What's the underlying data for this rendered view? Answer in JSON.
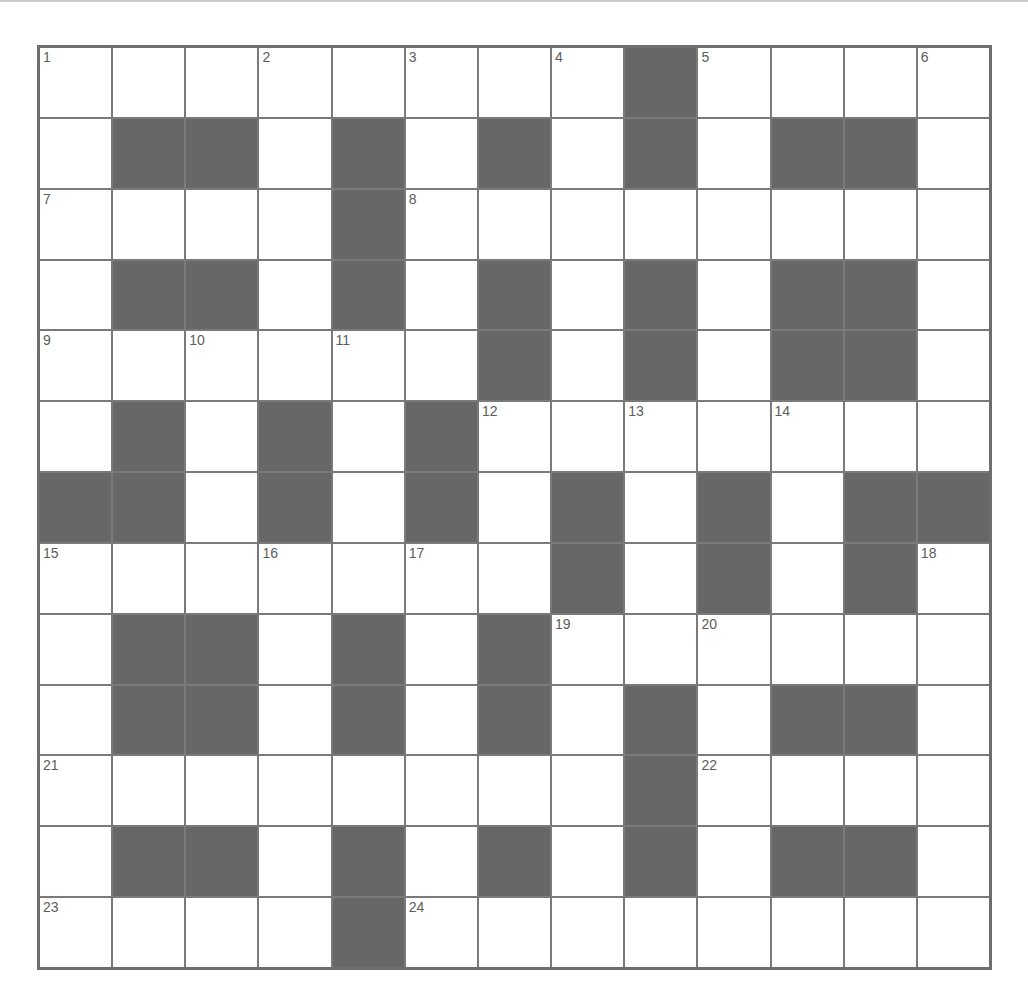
{
  "puzzle": {
    "rows": 13,
    "cols": 13,
    "colors": {
      "block": "#676767",
      "open": "#ffffff",
      "grid_line": "#7a7a7a",
      "number": "#5c5c5c"
    },
    "layout": [
      "........#....",
      ".##.#.#.#.##.",
      "....#........",
      ".##.#.#.#.##.",
      "......#.#.##.",
      ".#.#.#.......",
      "##.#.#.#.#.##",
      ".......#.#.#.",
      ".##.#.#......",
      ".##.#.#.#.##.",
      "........#....",
      ".##.#.#.#.##.",
      "....#........"
    ],
    "numbers": [
      {
        "r": 0,
        "c": 0,
        "n": "1"
      },
      {
        "r": 0,
        "c": 3,
        "n": "2"
      },
      {
        "r": 0,
        "c": 5,
        "n": "3"
      },
      {
        "r": 0,
        "c": 7,
        "n": "4"
      },
      {
        "r": 0,
        "c": 9,
        "n": "5"
      },
      {
        "r": 0,
        "c": 12,
        "n": "6"
      },
      {
        "r": 2,
        "c": 0,
        "n": "7"
      },
      {
        "r": 2,
        "c": 5,
        "n": "8"
      },
      {
        "r": 4,
        "c": 0,
        "n": "9"
      },
      {
        "r": 4,
        "c": 2,
        "n": "10"
      },
      {
        "r": 4,
        "c": 4,
        "n": "11"
      },
      {
        "r": 5,
        "c": 6,
        "n": "12"
      },
      {
        "r": 5,
        "c": 8,
        "n": "13"
      },
      {
        "r": 5,
        "c": 10,
        "n": "14"
      },
      {
        "r": 7,
        "c": 0,
        "n": "15"
      },
      {
        "r": 7,
        "c": 3,
        "n": "16"
      },
      {
        "r": 7,
        "c": 5,
        "n": "17"
      },
      {
        "r": 7,
        "c": 12,
        "n": "18"
      },
      {
        "r": 8,
        "c": 7,
        "n": "19"
      },
      {
        "r": 8,
        "c": 9,
        "n": "20"
      },
      {
        "r": 10,
        "c": 0,
        "n": "21"
      },
      {
        "r": 10,
        "c": 9,
        "n": "22"
      },
      {
        "r": 12,
        "c": 0,
        "n": "23"
      },
      {
        "r": 12,
        "c": 5,
        "n": "24"
      }
    ],
    "entries": {
      "across": [
        {
          "n": "1",
          "length": 8
        },
        {
          "n": "5",
          "length": 4
        },
        {
          "n": "7",
          "length": 4
        },
        {
          "n": "8",
          "length": 8
        },
        {
          "n": "9",
          "length": 6
        },
        {
          "n": "12",
          "length": 7
        },
        {
          "n": "15",
          "length": 7
        },
        {
          "n": "19",
          "length": 6
        },
        {
          "n": "21",
          "length": 8
        },
        {
          "n": "22",
          "length": 4
        },
        {
          "n": "23",
          "length": 4
        },
        {
          "n": "24",
          "length": 8
        }
      ],
      "down": [
        {
          "n": "1",
          "length": 6
        },
        {
          "n": "2",
          "length": 5
        },
        {
          "n": "3",
          "length": 5
        },
        {
          "n": "4",
          "length": 6
        },
        {
          "n": "5",
          "length": 5
        },
        {
          "n": "6",
          "length": 6
        },
        {
          "n": "10",
          "length": 4
        },
        {
          "n": "11",
          "length": 4
        },
        {
          "n": "13",
          "length": 4
        },
        {
          "n": "14",
          "length": 4
        },
        {
          "n": "15",
          "length": 6
        },
        {
          "n": "16",
          "length": 6
        },
        {
          "n": "17",
          "length": 5
        },
        {
          "n": "18",
          "length": 6
        },
        {
          "n": "19",
          "length": 5
        },
        {
          "n": "20",
          "length": 5
        }
      ]
    }
  }
}
